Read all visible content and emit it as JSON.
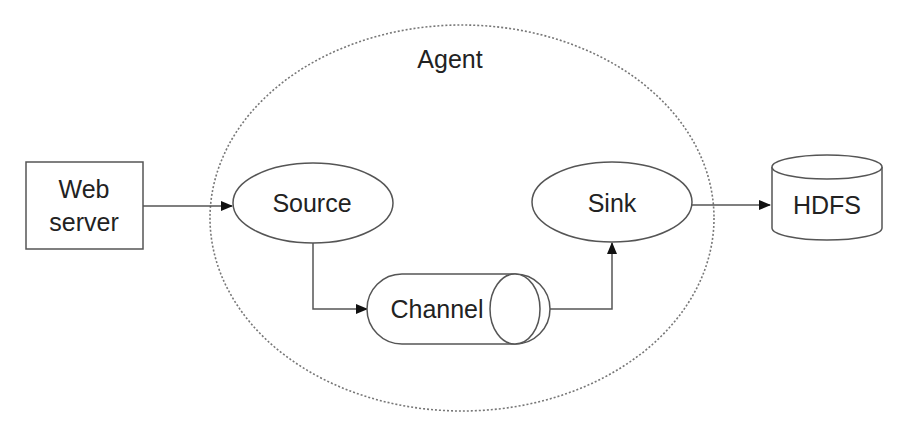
{
  "diagram": {
    "colors": {
      "stroke": "#555555",
      "dotted": "#777777",
      "text": "#222222",
      "background": "#ffffff"
    },
    "nodes": {
      "agent": {
        "label": "Agent",
        "shape": "dotted-ellipse"
      },
      "web_server": {
        "label_line1": "Web",
        "label_line2": "server",
        "shape": "rectangle"
      },
      "source": {
        "label": "Source",
        "shape": "ellipse"
      },
      "channel": {
        "label": "Channel",
        "shape": "horizontal-cylinder"
      },
      "sink": {
        "label": "Sink",
        "shape": "ellipse"
      },
      "hdfs": {
        "label": "HDFS",
        "shape": "database-cylinder"
      }
    },
    "edges": [
      {
        "from": "web_server",
        "to": "source"
      },
      {
        "from": "source",
        "to": "channel"
      },
      {
        "from": "channel",
        "to": "sink"
      },
      {
        "from": "sink",
        "to": "hdfs"
      }
    ]
  }
}
